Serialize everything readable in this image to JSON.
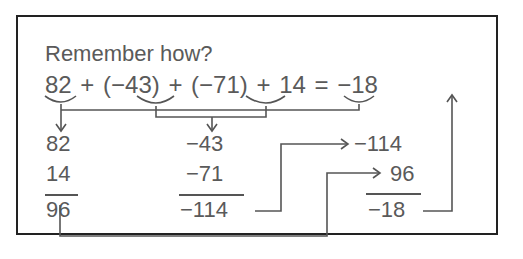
{
  "title": "Remember how?",
  "equation": {
    "terms": [
      "82",
      "+",
      "(−43)",
      "+",
      "(−71)",
      "+",
      "14",
      "=",
      "−18"
    ],
    "text": "82 + (−43) + (−71) + 14 = −18"
  },
  "column_positive": {
    "addends": [
      "82",
      "14"
    ],
    "sum": "96"
  },
  "column_negative": {
    "addends": [
      "−43",
      "−71"
    ],
    "sum": "−114"
  },
  "column_final": {
    "addends": [
      "−114",
      "96"
    ],
    "sum": "−18"
  },
  "colors": {
    "border": "#222222",
    "text": "#5a5a5a",
    "lines": "#555555"
  }
}
